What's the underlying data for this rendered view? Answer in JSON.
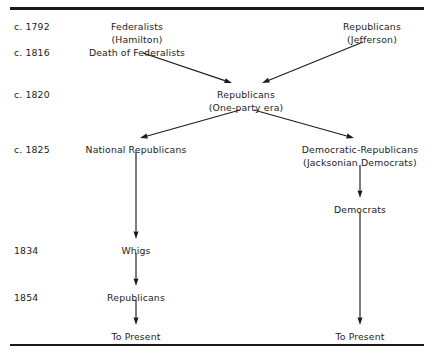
{
  "diagram": {
    "dates": [
      {
        "id": "date-1792",
        "label": "c. 1792",
        "x": 14,
        "y": 22
      },
      {
        "id": "date-1816",
        "label": "c. 1816",
        "x": 14,
        "y": 48
      },
      {
        "id": "date-1820",
        "label": "c. 1820",
        "x": 14,
        "y": 90
      },
      {
        "id": "date-1825",
        "label": "c. 1825",
        "x": 14,
        "y": 145
      },
      {
        "id": "date-1834",
        "label": "1834",
        "x": 14,
        "y": 246
      },
      {
        "id": "date-1854",
        "label": "1854",
        "x": 14,
        "y": 293
      }
    ],
    "nodes": [
      {
        "id": "node-federalists",
        "label": "Federalists",
        "x": 137,
        "y": 22
      },
      {
        "id": "node-hamilton",
        "label": "(Hamilton)",
        "x": 137,
        "y": 35
      },
      {
        "id": "node-death-of-federalists",
        "label": "Death of Federalists",
        "x": 137,
        "y": 48
      },
      {
        "id": "node-republicans-jefferson",
        "label": "Republicans",
        "x": 372,
        "y": 22
      },
      {
        "id": "node-jefferson",
        "label": "(Jefferson)",
        "x": 372,
        "y": 35
      },
      {
        "id": "node-republicans-one-party",
        "label": "Republicans",
        "x": 246,
        "y": 90
      },
      {
        "id": "node-one-party-era",
        "label": "(One-party era)",
        "x": 246,
        "y": 103
      },
      {
        "id": "node-national-republicans",
        "label": "National Republicans",
        "x": 136,
        "y": 145
      },
      {
        "id": "node-democratic-republicans",
        "label": "Democratic-Republicans",
        "x": 360,
        "y": 145
      },
      {
        "id": "node-jacksonian-democrats",
        "label": "(Jacksonian Democrats)",
        "x": 360,
        "y": 158
      },
      {
        "id": "node-democrats",
        "label": "Democrats",
        "x": 360,
        "y": 205
      },
      {
        "id": "node-whigs",
        "label": "Whigs",
        "x": 136,
        "y": 246
      },
      {
        "id": "node-republicans-1854",
        "label": "Republicans",
        "x": 136,
        "y": 293
      },
      {
        "id": "node-to-present-left",
        "label": "To Present",
        "x": 136,
        "y": 332
      },
      {
        "id": "node-to-present-right",
        "label": "To Present",
        "x": 360,
        "y": 332
      }
    ],
    "arrows": [
      {
        "id": "arrow-federalists-to-republicans",
        "x1": 143,
        "y1": 53,
        "x2": 232,
        "y2": 83
      },
      {
        "id": "arrow-jefferson-to-republicans",
        "x1": 363,
        "y1": 42,
        "x2": 262,
        "y2": 83
      },
      {
        "id": "arrow-republicans-to-national",
        "x1": 240,
        "y1": 110,
        "x2": 140,
        "y2": 138
      },
      {
        "id": "arrow-republicans-to-democratic",
        "x1": 254,
        "y1": 110,
        "x2": 354,
        "y2": 138
      },
      {
        "id": "arrow-national-to-whigs",
        "x1": 136,
        "y1": 152,
        "x2": 136,
        "y2": 239
      },
      {
        "id": "arrow-jacksonian-to-democrats",
        "x1": 360,
        "y1": 165,
        "x2": 360,
        "y2": 198
      },
      {
        "id": "arrow-whigs-to-republicans",
        "x1": 136,
        "y1": 253,
        "x2": 136,
        "y2": 286
      },
      {
        "id": "arrow-republicans-to-present",
        "x1": 136,
        "y1": 300,
        "x2": 136,
        "y2": 325
      },
      {
        "id": "arrow-democrats-to-present",
        "x1": 360,
        "y1": 212,
        "x2": 360,
        "y2": 325
      }
    ],
    "colors": {
      "ink": "#1c1c1c",
      "rule": "#1a1a1a",
      "background": "#ffffff"
    }
  }
}
